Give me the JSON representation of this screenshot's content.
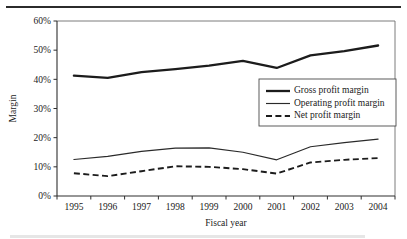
{
  "figure": {
    "has_top_rule": true,
    "background_color": "#ffffff",
    "ink_color": "#1a1a1a"
  },
  "chart_data": {
    "type": "line",
    "title": "",
    "xlabel": "Fiscal year",
    "ylabel": "Margin",
    "categories": [
      "1995",
      "1996",
      "1997",
      "1998",
      "1999",
      "2000",
      "2001",
      "2002",
      "2003",
      "2004"
    ],
    "x": [
      1995,
      1996,
      1997,
      1998,
      1999,
      2000,
      2001,
      2002,
      2003,
      2004
    ],
    "ylim": [
      0,
      60
    ],
    "ytick_values": [
      0,
      10,
      20,
      30,
      40,
      50,
      60
    ],
    "ytick_labels": [
      "0%",
      "10%",
      "20%",
      "30%",
      "40%",
      "50%",
      "60%"
    ],
    "grid": false,
    "legend_position": "center-right inside plot",
    "series": [
      {
        "name": "Gross profit margin",
        "style": "solid-thick",
        "color": "#1c1c1c",
        "values": [
          41.3,
          40.5,
          42.5,
          43.5,
          44.7,
          46.3,
          43.9,
          48.2,
          49.7,
          51.6
        ]
      },
      {
        "name": "Operating profit margin",
        "style": "solid-thin",
        "color": "#2a2a2a",
        "values": [
          12.5,
          13.6,
          15.3,
          16.4,
          16.5,
          15.0,
          12.4,
          16.9,
          18.3,
          19.5
        ]
      },
      {
        "name": "Net profit margin",
        "style": "dashed",
        "color": "#1c1c1c",
        "values": [
          7.8,
          6.8,
          8.5,
          10.2,
          10.0,
          9.2,
          7.7,
          11.5,
          12.4,
          13.0
        ]
      }
    ]
  },
  "legend": {
    "entries": [
      {
        "label": "Gross profit margin"
      },
      {
        "label": "Operating profit margin"
      },
      {
        "label": "Net profit margin"
      }
    ]
  }
}
